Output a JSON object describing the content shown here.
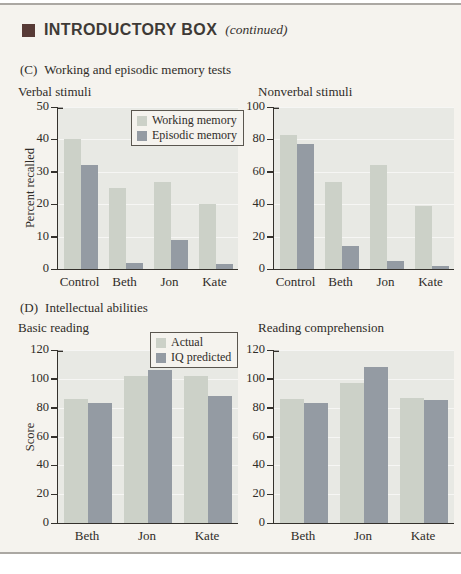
{
  "header": {
    "title": "INTRODUCTORY BOX",
    "continued": "(continued)"
  },
  "sections": {
    "c": {
      "prefix": "(C)",
      "title": "Working and episodic memory tests"
    },
    "d": {
      "prefix": "(D)",
      "title": "Intellectual abilities"
    }
  },
  "colors": {
    "page_bg": "#f5f3ee",
    "rule": "#aba8a3",
    "header_square": "#573a36",
    "plot_bg": "#e8e9e4",
    "series_light": "#ccd1c8",
    "series_dark": "#949ba3",
    "axis": "#34312c",
    "gridline": "rgba(255,255,255,0.6)",
    "legend_border": "#5a564f",
    "legend_bg": "#f5f3ee"
  },
  "chart_data": [
    {
      "type": "bar",
      "title": "Verbal stimuli",
      "ylabel": "Percent recalled",
      "ylim": [
        0,
        50
      ],
      "yticks": [
        0,
        10,
        20,
        30,
        40,
        50
      ],
      "grid": true,
      "legend_position": "top-right-inside",
      "legend_show": true,
      "categories": [
        "Control",
        "Beth",
        "Jon",
        "Kate"
      ],
      "series": [
        {
          "name": "Working memory",
          "values": [
            40,
            25,
            27,
            20
          ]
        },
        {
          "name": "Episodic memory",
          "values": [
            32,
            2,
            9,
            1.5
          ]
        }
      ]
    },
    {
      "type": "bar",
      "title": "Nonverbal stimuli",
      "ylabel": "",
      "ylim": [
        0,
        100
      ],
      "yticks": [
        0,
        20,
        40,
        60,
        80,
        100
      ],
      "grid": true,
      "legend_show": false,
      "categories": [
        "Control",
        "Beth",
        "Jon",
        "Kate"
      ],
      "series": [
        {
          "name": "Working memory",
          "values": [
            83,
            54,
            64,
            39
          ]
        },
        {
          "name": "Episodic memory",
          "values": [
            77,
            14,
            5,
            2
          ]
        }
      ]
    },
    {
      "type": "bar",
      "title": "Basic reading",
      "ylabel": "Score",
      "ylim": [
        0,
        120
      ],
      "yticks": [
        0,
        20,
        40,
        60,
        80,
        100,
        120
      ],
      "grid": true,
      "legend_position": "top-right-inside",
      "legend_show": true,
      "categories": [
        "Beth",
        "Jon",
        "Kate"
      ],
      "series": [
        {
          "name": "Actual",
          "values": [
            86,
            102,
            102
          ]
        },
        {
          "name": "IQ predicted",
          "values": [
            83,
            106,
            88
          ]
        }
      ]
    },
    {
      "type": "bar",
      "title": "Reading comprehension",
      "ylabel": "",
      "ylim": [
        0,
        120
      ],
      "yticks": [
        0,
        20,
        40,
        60,
        80,
        100,
        120
      ],
      "grid": true,
      "legend_show": false,
      "categories": [
        "Beth",
        "Jon",
        "Kate"
      ],
      "series": [
        {
          "name": "Actual",
          "values": [
            86,
            97,
            87
          ]
        },
        {
          "name": "IQ predicted",
          "values": [
            83,
            108,
            85
          ]
        }
      ]
    }
  ]
}
